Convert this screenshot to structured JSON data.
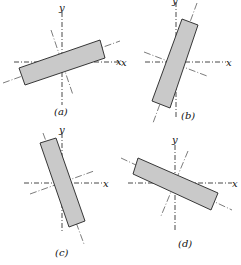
{
  "figure": {
    "panels": [
      {
        "id": "a",
        "caption": "(a)",
        "x_label": "x",
        "y_label": "y",
        "rotation_deg": -20,
        "orientation": "rectangle tilted counter-clockwise (low slope)"
      },
      {
        "id": "b",
        "caption": "(b)",
        "x_label": "x",
        "x_label_left": "x",
        "y_label": "y",
        "rotation_deg": 70,
        "orientation": "rectangle steep, leaning right"
      },
      {
        "id": "c",
        "caption": "(c)",
        "x_label": "x",
        "y_label": "y",
        "rotation_deg": 110,
        "orientation": "rectangle steep, leaning left"
      },
      {
        "id": "d",
        "caption": "(d)",
        "x_label": "x",
        "y_label": "y",
        "rotation_deg": 25,
        "orientation": "rectangle tilted clockwise (descending)"
      }
    ]
  }
}
